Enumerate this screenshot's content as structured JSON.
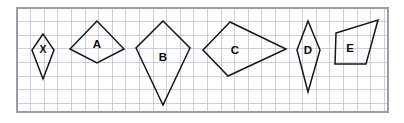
{
  "figure": {
    "colors": {
      "background": "#ffffff",
      "grid_line": "#b9bcc6",
      "frame_border": "#9a9da8",
      "shape_outline": "#14161a",
      "label_text": "#0c0d10"
    },
    "frame": {
      "x": 17,
      "y": 8,
      "width": 371,
      "height": 104
    },
    "grid": {
      "cell_size": 13.6,
      "visible": true,
      "columns": 27,
      "rows": 8
    },
    "shapes": [
      {
        "label": "X",
        "name": "kite-x",
        "type": "kite",
        "points": "43,34 32,50 43,79 54,50",
        "label_x": 43,
        "label_y": 49,
        "label_size": "small"
      },
      {
        "label": "A",
        "name": "kite-a",
        "type": "kite",
        "points": "97,21 70,49 97,63 124,49",
        "label_x": 97,
        "label_y": 44,
        "label_size": "normal"
      },
      {
        "label": "B",
        "name": "kite-b",
        "type": "kite",
        "points": "163,21 136,48 163,105 190,48",
        "label_x": 163,
        "label_y": 57,
        "label_size": "normal"
      },
      {
        "label": "C",
        "name": "kite-c",
        "type": "kite",
        "points": "230,22 203,50 228,76 286,49",
        "label_x": 235,
        "label_y": 50,
        "label_size": "normal"
      },
      {
        "label": "D",
        "name": "kite-d",
        "type": "rhombus",
        "points": "308,21 297,50 308,92 320,50",
        "label_x": 308,
        "label_y": 50,
        "label_size": "normal"
      },
      {
        "label": "E",
        "name": "quadrilateral-e",
        "type": "trapezium",
        "points": "336,33 378,20 366,64 335,64",
        "label_x": 350,
        "label_y": 48,
        "label_size": "normal"
      }
    ]
  }
}
